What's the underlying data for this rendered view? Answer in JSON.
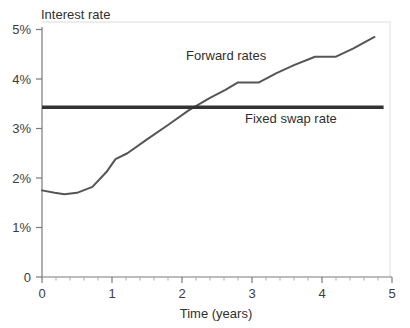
{
  "chart_data": {
    "type": "line",
    "title": "",
    "xlabel": "Time (years)",
    "ylabel": "Interest rate",
    "xlim": [
      0,
      5
    ],
    "ylim": [
      0,
      5
    ],
    "xticks": [
      "0",
      "1",
      "2",
      "3",
      "4",
      "5"
    ],
    "yticks": [
      "0",
      "1%",
      "2%",
      "3%",
      "4%",
      "5%"
    ],
    "grid": false,
    "legend_position": "inline-annotations",
    "series": [
      {
        "name": "Forward rates",
        "label_text": "Forward rates",
        "color": "#555555",
        "style": "piecewise-line",
        "x": [
          0.0,
          0.18,
          0.32,
          0.5,
          0.72,
          0.92,
          1.05,
          1.22,
          1.5,
          1.8,
          2.1,
          2.4,
          2.62,
          2.8,
          3.1,
          3.35,
          3.6,
          3.9,
          4.2,
          4.45,
          4.75
        ],
        "y": [
          1.75,
          1.7,
          1.67,
          1.7,
          1.82,
          2.12,
          2.38,
          2.5,
          2.78,
          3.07,
          3.37,
          3.62,
          3.78,
          3.93,
          3.93,
          4.12,
          4.28,
          4.45,
          4.45,
          4.62,
          4.85
        ]
      },
      {
        "name": "Fixed swap rate",
        "label_text": "Fixed swap rate",
        "color": "#333333",
        "style": "horizontal-line",
        "value": 3.43,
        "x_start": 0.0,
        "x_end": 4.88
      }
    ],
    "annotations": [
      {
        "text": "Forward rates",
        "x_px": 186,
        "y_px": 60
      },
      {
        "text": "Fixed swap rate",
        "x_px": 245,
        "y_px": 123
      },
      {
        "text": "Interest rate",
        "x_px": 41,
        "y_px": 19
      }
    ]
  },
  "axes": {
    "y_axis_title": "Interest rate",
    "x_axis_title": "Time (years)",
    "y_tick_labels": [
      "5%",
      "4%",
      "3%",
      "2%",
      "1%",
      "0"
    ],
    "x_tick_labels": [
      "0",
      "1",
      "2",
      "3",
      "4",
      "5"
    ]
  },
  "colors": {
    "forward_rates": "#555555",
    "fixed_swap_rate": "#333333",
    "axis": "#6e6e6e",
    "text": "#2f2f2f",
    "background": "#ffffff",
    "plot_border": "#e8e8e8"
  }
}
